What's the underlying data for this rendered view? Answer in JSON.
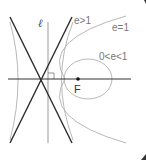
{
  "diagram": {
    "directrix_label": "ℓ",
    "focus_label": "F",
    "curves": [
      {
        "name": "hyperbola",
        "label": "e>1"
      },
      {
        "name": "parabola",
        "label": "e=1"
      },
      {
        "name": "ellipse",
        "label": "0<e<1"
      }
    ],
    "colors": {
      "asymptote": "#222222",
      "curve": "#a8a8a8",
      "axis": "#333333",
      "directrix": "#999999",
      "focus": "#111111"
    }
  }
}
